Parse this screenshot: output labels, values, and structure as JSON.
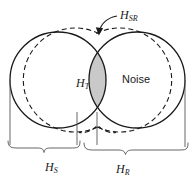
{
  "figure": {
    "name": "venn-diagram-hypothesis-spaces",
    "type": "venn-diagram",
    "background_color": "#ffffff",
    "stroke_color": "#1a1a1a",
    "intersection_fill_color": "#c9c9c9"
  },
  "labels": {
    "hsr": {
      "base": "H",
      "sub": "SR"
    },
    "ht": {
      "base": "H",
      "sub": "T"
    },
    "noise": "Noise",
    "hs": {
      "base": "H",
      "sub": "S"
    },
    "hr": {
      "base": "H",
      "sub": "R"
    }
  },
  "regions": {
    "left_circle": {
      "name": "H_S",
      "center_x": 58,
      "center_y": 80,
      "radius": 48,
      "fill": "#ffffff"
    },
    "right_circle": {
      "name": "H_R",
      "center_x": 137,
      "center_y": 80,
      "radius": 48,
      "fill": "#ffffff"
    },
    "intersection": {
      "name": "H_T",
      "fill": "#c9c9c9"
    },
    "union_dashed": {
      "name": "H_SR",
      "style": "dashed",
      "offset": 4
    }
  },
  "braces": {
    "left": {
      "label_key": "hs",
      "x_start": 7,
      "x_end": 80,
      "y": 148
    },
    "right": {
      "label_key": "hr",
      "x_start": 84,
      "x_end": 188,
      "y": 150
    }
  },
  "annotation_arrow": {
    "name": "hsr-pointer",
    "from_x": 118,
    "from_y": 16,
    "to_x": 99,
    "to_y": 34
  }
}
